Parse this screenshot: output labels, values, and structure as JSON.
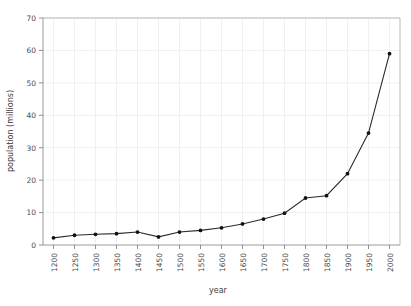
{
  "chart_data": {
    "type": "line",
    "title": "",
    "xlabel": "year",
    "ylabel": "population (millions)",
    "x": [
      1200,
      1250,
      1300,
      1350,
      1400,
      1450,
      1500,
      1550,
      1600,
      1650,
      1700,
      1750,
      1800,
      1850,
      1900,
      1950,
      2000
    ],
    "values": [
      2.2,
      3.0,
      3.3,
      3.5,
      4.0,
      2.5,
      4.0,
      4.5,
      5.3,
      6.5,
      8.0,
      9.8,
      14.5,
      15.2,
      22.0,
      34.5,
      59.0
    ],
    "series": [
      {
        "name": "population",
        "values": [
          2.2,
          3.0,
          3.3,
          3.5,
          4.0,
          2.5,
          4.0,
          4.5,
          5.3,
          6.5,
          8.0,
          9.8,
          14.5,
          15.2,
          22.0,
          34.5,
          59.0
        ]
      }
    ],
    "xlim": [
      1175,
      2025
    ],
    "ylim": [
      0,
      70
    ],
    "xticks": [
      1200,
      1250,
      1300,
      1350,
      1400,
      1450,
      1500,
      1550,
      1600,
      1650,
      1700,
      1750,
      1800,
      1850,
      1900,
      1950,
      2000
    ],
    "xtick_labels": [
      "1200",
      "1250",
      "1300",
      "1350",
      "1400",
      "1450",
      "1500",
      "1550",
      "1600",
      "1650",
      "1700",
      "1750",
      "1800",
      "1850",
      "1900",
      "1950",
      "2000"
    ],
    "yticks": [
      0,
      10,
      20,
      30,
      40,
      50,
      60,
      70
    ],
    "ytick_labels": [
      "0",
      "10",
      "20",
      "30",
      "40",
      "50",
      "60",
      "70"
    ],
    "grid": true,
    "legend": false,
    "legend_position": "none",
    "marker": "circle",
    "line_color": "#2b2b2b",
    "marker_color": "#111111",
    "grid_color": "#eef0f2",
    "background_color": "#ffffff",
    "xtick_label_rotation": -90
  }
}
